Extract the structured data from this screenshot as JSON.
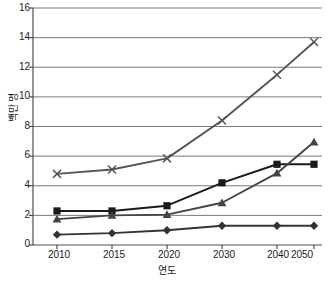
{
  "chart_data": {
    "type": "line",
    "title": "",
    "xlabel": "연도",
    "ylabel": "백만 명",
    "categories": [
      "2010",
      "2015",
      "2020",
      "2030",
      "2040",
      "2050"
    ],
    "x": [
      2010,
      2015,
      2020,
      2030,
      2040,
      2050
    ],
    "ylim": [
      0,
      16
    ],
    "yticks": [
      0,
      2,
      4,
      6,
      8,
      10,
      12,
      14,
      16
    ],
    "grid": true,
    "legend": "none",
    "series": [
      {
        "name": "series-1",
        "marker": "diamond",
        "color": "#333333",
        "values": [
          0.7,
          0.8,
          1.0,
          1.3,
          1.3,
          1.3
        ]
      },
      {
        "name": "series-2",
        "marker": "square",
        "color": "#1a1a1a",
        "values": [
          2.3,
          2.3,
          2.65,
          4.2,
          5.45,
          5.45
        ]
      },
      {
        "name": "series-3",
        "marker": "triangle",
        "color": "#444444",
        "values": [
          1.75,
          2.0,
          2.05,
          2.85,
          4.85,
          6.95
        ]
      },
      {
        "name": "series-4",
        "marker": "x",
        "color": "#555555",
        "values": [
          4.8,
          5.1,
          5.85,
          8.4,
          11.5,
          13.7
        ]
      }
    ]
  },
  "axis": {
    "y_tick_labels": [
      "16",
      "14",
      "12",
      "10",
      "8",
      "6",
      "4",
      "2",
      "0"
    ],
    "x_tick_labels": [
      "2010",
      "2015",
      "2020",
      "2030",
      "2040",
      "2050"
    ],
    "y_axis_title": "백만 명",
    "x_axis_title": "연도"
  },
  "colors": {
    "grid": "#7a7a7a",
    "axis": "#4d4d4d",
    "text": "#1a1a1a",
    "background": "#ffffff"
  }
}
